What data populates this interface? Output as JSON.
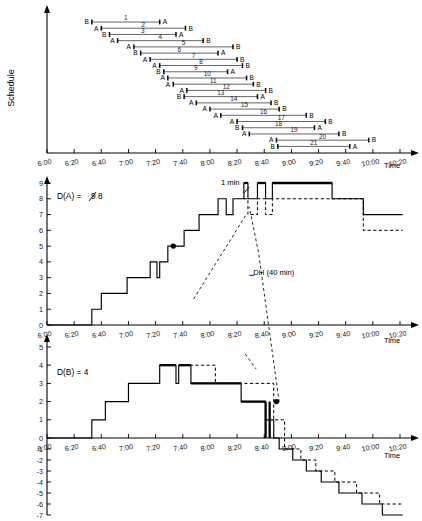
{
  "figure": {
    "time_axis": {
      "label": "Time",
      "ticks": [
        "6:00",
        "6:20",
        "6:40",
        "7:00",
        "7:20",
        "7:40",
        "8:00",
        "8:20",
        "8:40",
        "9:00",
        "9:20",
        "9:40",
        "10:00",
        "10:20"
      ],
      "tick_minutes": [
        360,
        380,
        400,
        420,
        440,
        460,
        480,
        500,
        520,
        540,
        560,
        580,
        600,
        620
      ],
      "min_minute": 360,
      "max_minute": 620
    },
    "colors": {
      "line": "#000000",
      "bar": "#555555",
      "text": "#000000",
      "background": "#ffffff"
    }
  },
  "schedule_panel": {
    "y_axis_label": "Schedule",
    "time_axis_label": "Time",
    "rows": [
      {
        "id": 1,
        "start_label": "B",
        "end_label": "A",
        "start": 393,
        "end": 443
      },
      {
        "id": 2,
        "start_label": "A",
        "end_label": "B",
        "start": 400,
        "end": 462
      },
      {
        "id": 3,
        "start_label": "B",
        "end_label": "A",
        "start": 406,
        "end": 455
      },
      {
        "id": 4,
        "start_label": "A",
        "end_label": "B",
        "start": 412,
        "end": 475
      },
      {
        "id": 5,
        "start_label": "A",
        "end_label": "B",
        "start": 424,
        "end": 497
      },
      {
        "id": 6,
        "start_label": "B",
        "end_label": "A",
        "start": 429,
        "end": 486
      },
      {
        "id": 7,
        "start_label": "A",
        "end_label": "B",
        "start": 436,
        "end": 500
      },
      {
        "id": 8,
        "start_label": "A",
        "end_label": "B",
        "start": 443,
        "end": 504
      },
      {
        "id": 9,
        "start_label": "B",
        "end_label": "A",
        "start": 446,
        "end": 493
      },
      {
        "id": 10,
        "start_label": "A",
        "end_label": "B",
        "start": 449,
        "end": 507
      },
      {
        "id": 11,
        "start_label": "A",
        "end_label": "B",
        "start": 453,
        "end": 512
      },
      {
        "id": 12,
        "start_label": "A",
        "end_label": "B",
        "start": 463,
        "end": 521
      },
      {
        "id": 13,
        "start_label": "B",
        "end_label": "A",
        "start": 461,
        "end": 515
      },
      {
        "id": 14,
        "start_label": "A",
        "end_label": "B",
        "start": 470,
        "end": 525
      },
      {
        "id": 15,
        "start_label": "A",
        "end_label": "B",
        "start": 480,
        "end": 531
      },
      {
        "id": 16,
        "start_label": "A",
        "end_label": "B",
        "start": 488,
        "end": 551
      },
      {
        "id": 17,
        "start_label": "A",
        "end_label": "B",
        "start": 500,
        "end": 565
      },
      {
        "id": 18,
        "start_label": "B",
        "end_label": "A",
        "start": 504,
        "end": 557
      },
      {
        "id": 19,
        "start_label": "A",
        "end_label": "B",
        "start": 509,
        "end": 575
      },
      {
        "id": 20,
        "start_label": "A",
        "end_label": "B",
        "start": 529,
        "end": 597
      },
      {
        "id": 21,
        "start_label": "B",
        "end_label": "A",
        "start": 530,
        "end": 583
      }
    ]
  },
  "panel_a": {
    "label_prefix": "D(A) = ",
    "label_struck": "9",
    "label_value": "8",
    "y_ticks": [
      0,
      1,
      2,
      3,
      4,
      5,
      6,
      7,
      8,
      9
    ],
    "y_min": 0,
    "y_max": 9,
    "time_axis_label": "Time",
    "annotations": [
      {
        "name": "one-min",
        "text": "1 min",
        "x": 495,
        "y": 8.85
      },
      {
        "name": "deadhead",
        "text": "DH (40 min)",
        "x": 512,
        "y": 3.15
      }
    ],
    "marker_point": {
      "time": 453,
      "value": 5
    },
    "solid_steps": [
      {
        "t": 360,
        "v": 0
      },
      {
        "t": 393,
        "v": 1
      },
      {
        "t": 400,
        "v": 2
      },
      {
        "t": 419,
        "v": 3
      },
      {
        "t": 436,
        "v": 4
      },
      {
        "t": 441,
        "v": 3
      },
      {
        "t": 443,
        "v": 4
      },
      {
        "t": 449,
        "v": 5
      },
      {
        "t": 461,
        "v": 6
      },
      {
        "t": 472,
        "v": 7
      },
      {
        "t": 486,
        "v": 8
      },
      {
        "t": 492,
        "v": 7
      },
      {
        "t": 497,
        "v": 8
      },
      {
        "t": 505,
        "v": 9
      },
      {
        "t": 508,
        "v": 8
      },
      {
        "t": 515,
        "v": 9
      },
      {
        "t": 521,
        "v": 8
      },
      {
        "t": 526,
        "v": 9
      },
      {
        "t": 570,
        "v": 8
      },
      {
        "t": 593,
        "v": 7
      },
      {
        "t": 622,
        "v": 7
      }
    ],
    "bold_segments": [
      {
        "t_start": 505,
        "t_end": 508,
        "v": 9
      },
      {
        "t_start": 515,
        "t_end": 521,
        "v": 9
      },
      {
        "t_start": 526,
        "t_end": 570,
        "v": 9
      }
    ],
    "dashed_steps": [
      {
        "t": 505,
        "v": 8
      },
      {
        "t": 508,
        "v": 7
      },
      {
        "t": 515,
        "v": 8
      },
      {
        "t": 521,
        "v": 7
      },
      {
        "t": 526,
        "v": 8
      },
      {
        "t": 570,
        "v": 8
      },
      {
        "t": 593,
        "v": 6
      },
      {
        "t": 622,
        "v": 6
      }
    ]
  },
  "panel_b": {
    "label": "D(B) = 4",
    "y_ticks": [
      5,
      4,
      3,
      2,
      1,
      0,
      -1,
      -2,
      -3,
      -4,
      -5,
      -6,
      -7
    ],
    "y_min": -7,
    "y_max": 5,
    "time_axis_label": "Time",
    "marker_point": {
      "time": 529,
      "value": 2
    },
    "annotations": [
      {
        "name": "panel-b-arrow",
        "text": "",
        "x": 0,
        "y": 0
      }
    ],
    "solid_steps": [
      {
        "t": 360,
        "v": 0
      },
      {
        "t": 393,
        "v": 1
      },
      {
        "t": 403,
        "v": 2
      },
      {
        "t": 420,
        "v": 3
      },
      {
        "t": 443,
        "v": 4
      },
      {
        "t": 455,
        "v": 3
      },
      {
        "t": 457,
        "v": 4
      },
      {
        "t": 466,
        "v": 3
      },
      {
        "t": 503,
        "v": 2
      },
      {
        "t": 521,
        "v": 1
      },
      {
        "t": 527,
        "v": 0
      },
      {
        "t": 531,
        "v": -1
      },
      {
        "t": 541,
        "v": -2
      },
      {
        "t": 551,
        "v": -3
      },
      {
        "t": 562,
        "v": -4
      },
      {
        "t": 575,
        "v": -5
      },
      {
        "t": 592,
        "v": -6
      },
      {
        "t": 607,
        "v": -7
      },
      {
        "t": 622,
        "v": -7
      }
    ],
    "bold_segments": [
      {
        "t_start": 443,
        "t_end": 455,
        "v": 4
      },
      {
        "t_start": 457,
        "t_end": 466,
        "v": 4
      },
      {
        "t_start": 466,
        "t_end": 503,
        "v": 3
      },
      {
        "t_start": 503,
        "t_end": 521,
        "v": 2
      }
    ],
    "dashed_steps": [
      {
        "t": 461,
        "v": 4
      },
      {
        "t": 484,
        "v": 4
      },
      {
        "t": 484,
        "v": 3
      },
      {
        "t": 509,
        "v": 3
      },
      {
        "t": 527,
        "v": 1
      },
      {
        "t": 531,
        "v": 1
      },
      {
        "t": 535,
        "v": -1
      },
      {
        "t": 547,
        "v": -2
      },
      {
        "t": 558,
        "v": -3
      },
      {
        "t": 572,
        "v": -4
      },
      {
        "t": 588,
        "v": -5
      },
      {
        "t": 605,
        "v": -6
      },
      {
        "t": 622,
        "v": -6
      }
    ]
  }
}
